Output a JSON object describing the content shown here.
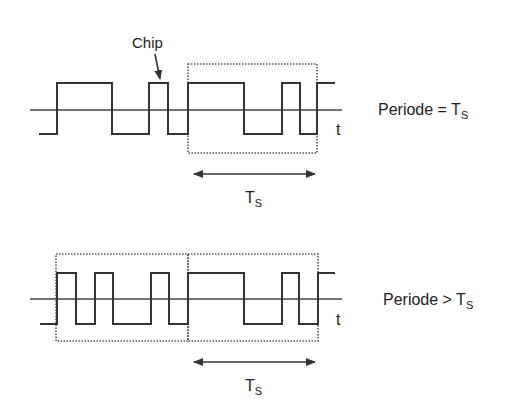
{
  "diagram": {
    "top": {
      "chip_label": "Chip",
      "time_axis_label": "t",
      "caption": {
        "prefix": "Periode = T",
        "subscript": "S"
      },
      "period_label": {
        "main": "T",
        "subscript": "S"
      },
      "levels": "bipolar",
      "chip_sequence_description": "random binary chips; one symbol period Ts marked with a dotted box"
    },
    "bottom": {
      "time_axis_label": "t",
      "caption": {
        "prefix": "Periode > T",
        "subscript": "S"
      },
      "period_label": {
        "main": "T",
        "subscript": "S"
      },
      "levels": "bipolar",
      "chip_sequence_description": "chip sequence spanning two symbol windows; code period longer than Ts"
    }
  }
}
